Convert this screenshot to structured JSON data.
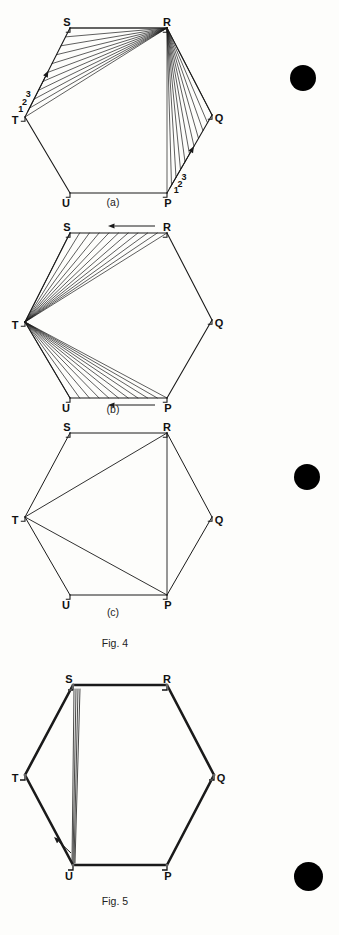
{
  "page": {
    "background": "#fdfdfb",
    "ink": "#111111",
    "width": 339,
    "height": 935
  },
  "figures": [
    {
      "id": "fig4a",
      "sublabel": "(a)",
      "kind": "hexagon-construction",
      "description": "Hexagon PQRSTU with fan of chords radiating from vertex R to division points on sides TS and PQ",
      "vertices": [
        {
          "name": "R",
          "x": 167,
          "y": 28,
          "label_dx": 0,
          "label_dy": -5
        },
        {
          "name": "S",
          "x": 70,
          "y": 28,
          "label_dx": -3,
          "label_dy": -5
        },
        {
          "name": "T",
          "x": 25,
          "y": 117,
          "label_dx": -10,
          "label_dy": 4
        },
        {
          "name": "U",
          "x": 70,
          "y": 193,
          "label_dx": -4,
          "label_dy": 11
        },
        {
          "name": "P",
          "x": 167,
          "y": 193,
          "label_dx": 1,
          "label_dy": 11
        },
        {
          "name": "Q",
          "x": 212,
          "y": 115,
          "label_dx": 7,
          "label_dy": 4
        }
      ],
      "division_labels_left": [
        "1",
        "2",
        "3"
      ],
      "division_labels_right": [
        "1",
        "2",
        "3"
      ],
      "fan_count": 10,
      "arrows": [
        {
          "name": "left-division-arrow",
          "from": "T",
          "to": "S",
          "direction": "up-right"
        },
        {
          "name": "right-division-arrow",
          "from": "P",
          "to": "Q",
          "direction": "up-right"
        }
      ]
    },
    {
      "id": "fig4b",
      "sublabel": "(b)",
      "kind": "hexagon-construction",
      "description": "Hexagon PQRSTU with fan of chords radiating from vertex T to division points on sides SR and UP; arrows on SR and UP point left",
      "vertices": [
        {
          "name": "R",
          "x": 167,
          "y": 18,
          "label_dx": 0,
          "label_dy": -5
        },
        {
          "name": "S",
          "x": 70,
          "y": 18,
          "label_dx": -3,
          "label_dy": -5
        },
        {
          "name": "T",
          "x": 25,
          "y": 107,
          "label_dx": -10,
          "label_dy": 4
        },
        {
          "name": "U",
          "x": 70,
          "y": 183,
          "label_dx": -4,
          "label_dy": 11
        },
        {
          "name": "P",
          "x": 167,
          "y": 183,
          "label_dx": 1,
          "label_dy": 11
        },
        {
          "name": "Q",
          "x": 212,
          "y": 105,
          "label_dx": 7,
          "label_dy": 4
        }
      ],
      "fan_count": 10,
      "arrows": [
        {
          "name": "top-edge-arrow",
          "on_edge": "SR",
          "direction": "left"
        },
        {
          "name": "bottom-edge-arrow",
          "on_edge": "UP",
          "direction": "left"
        }
      ]
    },
    {
      "id": "fig4c",
      "sublabel": "(c)",
      "kind": "hexagon-result",
      "description": "Hexagon PQRSTU with diagonals TR, TP and RP drawn",
      "vertices": [
        {
          "name": "R",
          "x": 167,
          "y": 18,
          "label_dx": 0,
          "label_dy": -5
        },
        {
          "name": "S",
          "x": 70,
          "y": 18,
          "label_dx": -3,
          "label_dy": -5
        },
        {
          "name": "T",
          "x": 25,
          "y": 102,
          "label_dx": -10,
          "label_dy": 4
        },
        {
          "name": "U",
          "x": 70,
          "y": 180,
          "label_dx": -4,
          "label_dy": 11
        },
        {
          "name": "P",
          "x": 167,
          "y": 180,
          "label_dx": 1,
          "label_dy": 11
        },
        {
          "name": "Q",
          "x": 212,
          "y": 102,
          "label_dx": 7,
          "label_dy": 4
        }
      ],
      "diagonals": [
        [
          "T",
          "R"
        ],
        [
          "T",
          "P"
        ],
        [
          "R",
          "P"
        ]
      ]
    },
    {
      "id": "fig5",
      "sublabel": "",
      "kind": "hexagon-bold",
      "description": "Bold-outlined hexagon PQRSTU with a narrow sheaf of thin lines from S converging to U and an arrow near U",
      "vertices": [
        {
          "name": "R",
          "x": 167,
          "y": 25,
          "label_dx": 0,
          "label_dy": -5
        },
        {
          "name": "S",
          "x": 73,
          "y": 25,
          "label_dx": -4,
          "label_dy": -5
        },
        {
          "name": "T",
          "x": 25,
          "y": 115,
          "label_dx": -10,
          "label_dy": 4
        },
        {
          "name": "U",
          "x": 73,
          "y": 205,
          "label_dx": -4,
          "label_dy": 12
        },
        {
          "name": "P",
          "x": 167,
          "y": 205,
          "label_dx": 1,
          "label_dy": 12
        },
        {
          "name": "Q",
          "x": 214,
          "y": 115,
          "label_dx": 7,
          "label_dy": 4
        }
      ],
      "sheaf_count": 4,
      "arrows": [
        {
          "name": "sheaf-arrow",
          "direction": "up-left"
        }
      ]
    }
  ],
  "captions": {
    "fig4_sub_a": "(a)",
    "fig4_sub_b": "(b)",
    "fig4_sub_c": "(c)",
    "fig4": "Fig. 4",
    "fig5": "Fig. 5"
  },
  "margin_marks": [
    {
      "name": "margin-dot-1",
      "x": 290,
      "y": 65,
      "size": 26,
      "color": "#000000"
    },
    {
      "name": "margin-dot-2",
      "x": 294,
      "y": 464,
      "size": 26,
      "color": "#000000"
    },
    {
      "name": "margin-dot-3",
      "x": 294,
      "y": 862,
      "size": 29,
      "color": "#000000"
    }
  ]
}
